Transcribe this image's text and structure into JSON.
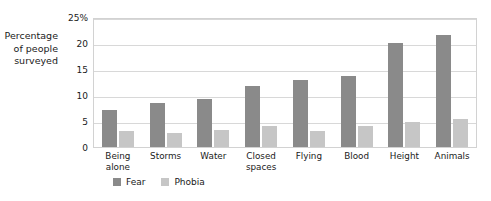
{
  "chart_data": {
    "type": "bar",
    "title": "",
    "xlabel": "",
    "ylabel": "Percentage of people surveyed",
    "ylim": [
      0,
      25
    ],
    "yticks": [
      "0",
      "5",
      "10",
      "15",
      "20",
      "25%"
    ],
    "ytick_values": [
      0,
      5,
      10,
      15,
      20,
      25
    ],
    "grid": true,
    "legend_position": "bottom-left",
    "categories": [
      "Being\nalone",
      "Storms",
      "Water",
      "Closed\nspaces",
      "Flying",
      "Blood",
      "Height",
      "Animals"
    ],
    "series": [
      {
        "name": "Fear",
        "color": "#8a8a8a",
        "values": [
          7.3,
          8.6,
          9.4,
          12.0,
          13.0,
          13.8,
          20.3,
          21.9
        ]
      },
      {
        "name": "Phobia",
        "color": "#c6c6c6",
        "values": [
          3.1,
          2.8,
          3.3,
          4.1,
          3.2,
          4.1,
          4.9,
          5.4
        ]
      }
    ]
  },
  "colors": {
    "fear": "#8a8a8a",
    "phobia": "#c6c6c6",
    "gridline": "#d8d8d8",
    "text": "#1a1a1a"
  }
}
